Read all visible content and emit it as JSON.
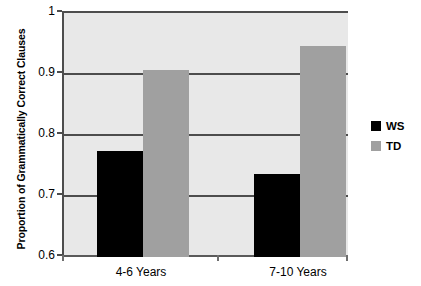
{
  "chart_data": {
    "type": "bar",
    "title": "",
    "xlabel": "",
    "ylabel": "Proportion of Grammatically Correct Clauses",
    "ylim": [
      0.6,
      1.0
    ],
    "yticks": [
      "0.6",
      "0.7",
      "0.8",
      "0.9",
      "1"
    ],
    "ytick_values": [
      0.6,
      0.7,
      0.8,
      0.9,
      1.0
    ],
    "grid": true,
    "legend_position": "right",
    "categories": [
      "4-6 Years",
      "7-10 Years"
    ],
    "series": [
      {
        "name": "WS",
        "color": "#000000",
        "values": [
          0.773,
          0.736
        ]
      },
      {
        "name": "TD",
        "color": "#a0a0a0",
        "values": [
          0.907,
          0.946
        ]
      }
    ],
    "colors": {
      "plot_background": "#e8e8e8",
      "gridline": "#4d4d4d",
      "axis": "#4d4d4d",
      "page_background": "#ffffff",
      "text": "#000000"
    }
  },
  "legend": {
    "items": [
      {
        "label": "WS",
        "color": "#000000"
      },
      {
        "label": "TD",
        "color": "#a0a0a0"
      }
    ]
  }
}
